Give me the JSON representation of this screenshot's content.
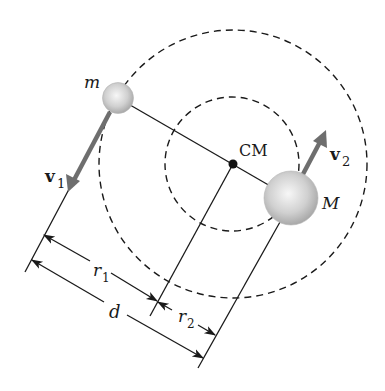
{
  "diagram": {
    "labels": {
      "small_mass": "m",
      "large_mass": "M",
      "center_of_mass": "CM",
      "velocity_small": "v",
      "velocity_small_sub": "1",
      "velocity_large": "v",
      "velocity_large_sub": "2",
      "radius_small_orbit": "r",
      "radius_small_orbit_sub": "1",
      "radius_large_orbit": "r",
      "radius_large_orbit_sub": "2",
      "separation": "d"
    },
    "colors": {
      "line": "#1a1a1a",
      "arrow": "#6e6e6e",
      "sphere_light": "#f2f2f2",
      "sphere_dark": "#a8a8a8",
      "background": "#ffffff"
    },
    "orbits": [
      {
        "name": "orbit of m",
        "style": "dashed"
      },
      {
        "name": "orbit of M",
        "style": "dashed"
      }
    ]
  }
}
